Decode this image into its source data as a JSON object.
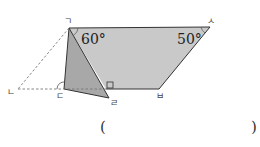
{
  "figure": {
    "vertices": {
      "g": {
        "label": "ㄱ",
        "x": 69,
        "y": 28
      },
      "n": {
        "label": "ㄴ",
        "x": 18,
        "y": 89
      },
      "d": {
        "label": "ㄷ",
        "x": 64,
        "y": 89
      },
      "r": {
        "label": "ㄹ",
        "x": 109,
        "y": 98
      },
      "m": {
        "label": "ㅁ",
        "x": 106,
        "y": 89
      },
      "b": {
        "label": "ㅂ",
        "x": 159,
        "y": 89
      },
      "s": {
        "label": "ㅅ",
        "x": 210,
        "y": 27
      }
    },
    "angles": {
      "top_left": "60°",
      "top_right": "50°"
    },
    "colors": {
      "fill_light": "#c8c8c8",
      "fill_dark": "#a9a9a9",
      "stroke": "#333333",
      "dashed": "#777777"
    }
  },
  "answer": {
    "open_paren": "(",
    "close_paren": ")"
  }
}
